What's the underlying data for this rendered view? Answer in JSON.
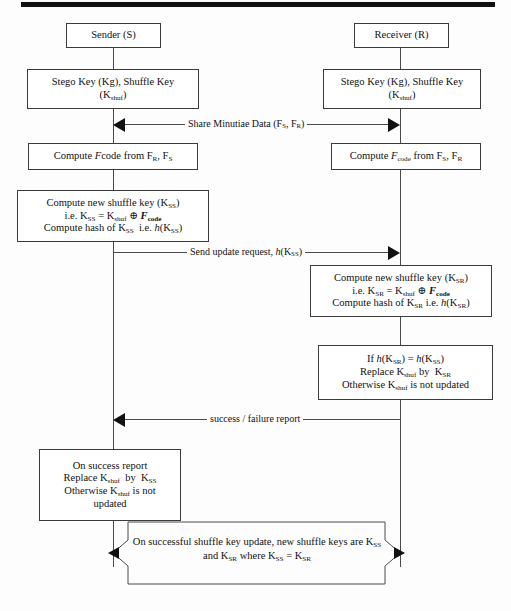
{
  "diagram": {
    "type": "sequence-diagram",
    "actors": [
      {
        "id": "sender",
        "label": "Sender (S)"
      },
      {
        "id": "receiver",
        "label": "Receiver (R)"
      }
    ],
    "sender_nodes": [
      {
        "id": "sender-keys",
        "lines": [
          "Stego Key (Kg), Shuffle Key",
          "(K<sub>shuf</sub>)"
        ]
      },
      {
        "id": "sender-fcode",
        "lines": [
          "Compute <i>F</i>code from F<sub>R</sub>, F<sub>S</sub>"
        ]
      },
      {
        "id": "sender-newkey",
        "lines": [
          "Compute new shuffle key (K<sub>SS</sub>)",
          "i.e. K<sub>SS</sub> = K<sub>shuf</sub> &#8853; <b><i>F</i><sub>code</sub></b>",
          "Compute hash of K<sub>SS</sub>&nbsp; i.e. <i>h</i>(K<sub>SS</sub>)"
        ]
      },
      {
        "id": "sender-onsuccess",
        "lines": [
          "On success report",
          "Replace K<sub>shuf</sub>&nbsp; by&nbsp; K<sub>SS</sub>",
          "Otherwise K<sub>shuf</sub> is not",
          "updated"
        ]
      }
    ],
    "receiver_nodes": [
      {
        "id": "receiver-keys",
        "lines": [
          "Stego Key (Kg), Shuffle Key",
          "(K<sub>shuf</sub>)"
        ]
      },
      {
        "id": "receiver-fcode",
        "lines": [
          "Compute <i>F</i><sub>code</sub> from F<sub>S</sub>, F<sub>R</sub>"
        ]
      },
      {
        "id": "receiver-newkey",
        "lines": [
          "Compute new shuffle key (K<sub>SR</sub>)",
          "i.e. K<sub>SR</sub> = K<sub>shuf</sub> &#8853; <b><i>F</i><sub>code</sub></b>",
          "Compute hash of K<sub>SR</sub> i.e. <i>h</i>(K<sub>SR</sub>)"
        ]
      },
      {
        "id": "receiver-verify",
        "lines": [
          "If <i>h</i>(K<sub>SR</sub>) = <i>h</i>(K<sub>SS</sub>)",
          "Replace K<sub>shuf</sub> by&nbsp; K<sub>SR</sub>",
          "Otherwise K<sub>shuf</sub> is not updated"
        ]
      }
    ],
    "messages": [
      {
        "id": "share-minutiae",
        "label": "Share Minutiae Data (F<sub>S</sub>, F<sub>R</sub>)",
        "direction": "both"
      },
      {
        "id": "send-update-request",
        "label": "Send update request, <i>h</i>(K<sub>SS</sub>)",
        "direction": "right"
      },
      {
        "id": "success-failure-report",
        "label": "success / failure report",
        "direction": "left"
      }
    ],
    "bottom_note": {
      "id": "final-note",
      "lines": [
        "On successful shuffle key update, new shuffle keys are K<sub>SS</sub>",
        "and K<sub>SR</sub> where K<sub>SS</sub> = K<sub>SR</sub>"
      ],
      "direction": "both"
    },
    "colors": {
      "stroke": "#3b3b3b",
      "lifeline": "#4a4a4a",
      "arrowhead": "#111111",
      "background": "#fdfdfd",
      "topbar": "#111111"
    }
  }
}
